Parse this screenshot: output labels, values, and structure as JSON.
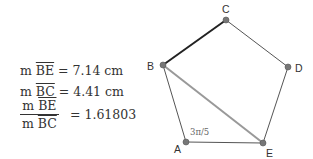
{
  "measurements": {
    "be": {
      "prefix": "m ",
      "segment": "BE",
      "equals": " = ",
      "value": "7.14 cm"
    },
    "bc": {
      "prefix": "m ",
      "segment": "BC",
      "equals": " = ",
      "value": "4.41 cm"
    },
    "ratio": {
      "numerator_prefix": "m ",
      "numerator_segment": "BE",
      "denominator_prefix": "m ",
      "denominator_segment": "BC",
      "equals": "= ",
      "value": "1.61803"
    }
  },
  "figure": {
    "vertices": {
      "A": {
        "label": "A",
        "x": 186,
        "y": 142
      },
      "B": {
        "label": "B",
        "x": 163,
        "y": 65
      },
      "C": {
        "label": "C",
        "x": 226,
        "y": 20
      },
      "D": {
        "label": "D",
        "x": 288,
        "y": 67
      },
      "E": {
        "label": "E",
        "x": 263,
        "y": 143
      }
    },
    "angle_label": "3π/5",
    "colors": {
      "edge": "#555555",
      "bc_highlight": "#222222",
      "be_diagonal": "#999999",
      "point": "#777777"
    }
  }
}
